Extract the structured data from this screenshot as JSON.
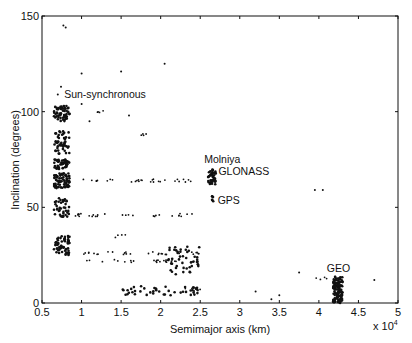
{
  "chart_data": {
    "type": "scatter",
    "title": "",
    "xlabel": "Semimajor axis (km)",
    "ylabel": "Inclination (degrees)",
    "x_multiplier_label": "x 10",
    "x_multiplier_exp": "4",
    "xlim": [
      0.5,
      5
    ],
    "ylim": [
      0,
      150
    ],
    "xticks": [
      0.5,
      1,
      1.5,
      2,
      2.5,
      3,
      3.5,
      4,
      4.5,
      5
    ],
    "xtick_labels": [
      "0.5",
      "1",
      "1.5",
      "2",
      "2.5",
      "3",
      "3.5",
      "4",
      "4.5",
      "5"
    ],
    "yticks": [
      0,
      50,
      100,
      150
    ],
    "ytick_labels": [
      "0",
      "50",
      "100",
      "150"
    ],
    "grid": false,
    "legend": null,
    "annotations": [
      {
        "text": "Sun-synchronous",
        "x": 0.78,
        "y": 107
      },
      {
        "text": "Molniya",
        "x": 2.55,
        "y": 73
      },
      {
        "text": "GLONASS",
        "x": 2.73,
        "y": 67
      },
      {
        "text": "GPS",
        "x": 2.72,
        "y": 52
      },
      {
        "text": "GEO",
        "x": 4.1,
        "y": 16
      }
    ],
    "clusters": [
      {
        "name": "LEO polar / sun-synchronous",
        "x_range": [
          0.65,
          0.85
        ],
        "y_range": [
          95,
          103
        ],
        "n": 60
      },
      {
        "name": "LEO 80-90 deg",
        "x_range": [
          0.65,
          0.85
        ],
        "y_range": [
          78,
          90
        ],
        "n": 50
      },
      {
        "name": "LEO 70-75 deg",
        "x_range": [
          0.65,
          0.85
        ],
        "y_range": [
          70,
          75
        ],
        "n": 50
      },
      {
        "name": "LEO 60-68 deg",
        "x_range": [
          0.65,
          0.85
        ],
        "y_range": [
          60,
          68
        ],
        "n": 70
      },
      {
        "name": "LEO 45-55 deg",
        "x_range": [
          0.65,
          0.85
        ],
        "y_range": [
          45,
          55
        ],
        "n": 40
      },
      {
        "name": "LEO 25-35 deg",
        "x_range": [
          0.65,
          0.85
        ],
        "y_range": [
          25,
          35
        ],
        "n": 60
      },
      {
        "name": "Molniya/GLONASS",
        "x_range": [
          2.6,
          2.7
        ],
        "y_range": [
          62,
          70
        ],
        "n": 40
      },
      {
        "name": "GPS",
        "x_range": [
          2.65,
          2.67
        ],
        "y_range": [
          53,
          56
        ],
        "n": 6
      },
      {
        "name": "GEO",
        "x_range": [
          4.18,
          4.3
        ],
        "y_range": [
          0,
          14
        ],
        "n": 120
      },
      {
        "name": "GTO 20-30 deg",
        "x_range": [
          2.1,
          2.5
        ],
        "y_range": [
          15,
          30
        ],
        "n": 45
      },
      {
        "name": "GTO ~7 deg",
        "x_range": [
          1.5,
          2.5
        ],
        "y_range": [
          4,
          9
        ],
        "n": 45
      }
    ],
    "streaks": [
      {
        "y": 64,
        "x_range": [
          0.9,
          2.5
        ]
      },
      {
        "y": 46,
        "x_range": [
          0.9,
          2.5
        ]
      },
      {
        "y": 35,
        "x_range": [
          1.4,
          1.6
        ]
      },
      {
        "y": 26,
        "x_range": [
          0.9,
          2.5
        ]
      },
      {
        "y": 22,
        "x_range": [
          0.9,
          2.4
        ]
      },
      {
        "y": 7,
        "x_range": [
          2.2,
          2.5
        ]
      },
      {
        "y": 88,
        "x_range": [
          1.75,
          1.82
        ]
      },
      {
        "y": 100,
        "x_range": [
          1.2,
          1.3
        ]
      },
      {
        "y": 13,
        "x_range": [
          3.95,
          4.1
        ]
      }
    ],
    "outliers": [
      [
        0.77,
        145
      ],
      [
        0.8,
        144
      ],
      [
        1.0,
        120
      ],
      [
        1.5,
        121
      ],
      [
        2.05,
        125
      ],
      [
        0.74,
        113
      ],
      [
        0.7,
        109
      ],
      [
        1.0,
        104
      ],
      [
        1.1,
        95
      ],
      [
        1.6,
        98
      ],
      [
        3.95,
        59
      ],
      [
        4.05,
        59
      ],
      [
        3.75,
        16
      ],
      [
        4.7,
        12
      ],
      [
        3.5,
        4
      ],
      [
        3.2,
        6
      ],
      [
        3.4,
        2
      ]
    ]
  }
}
